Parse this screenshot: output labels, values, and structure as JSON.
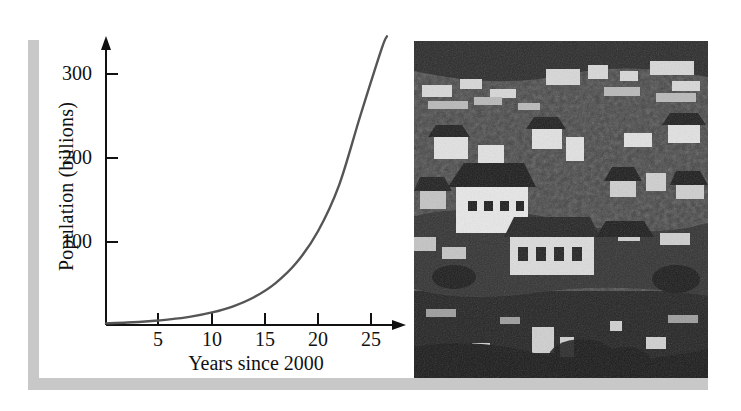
{
  "figure": {
    "kind": "textbook-figure",
    "caption_visible": false
  },
  "chart_data": {
    "type": "line",
    "title": "",
    "xlabel": "Years since 2000",
    "ylabel": "Population (billions)",
    "xlim": [
      0,
      27.5
    ],
    "ylim": [
      0,
      345
    ],
    "xticks": [
      5,
      10,
      15,
      20,
      25
    ],
    "xtick_labels": [
      "5",
      "10",
      "15",
      "20",
      "25"
    ],
    "yticks": [
      100,
      200,
      300
    ],
    "ytick_labels": [
      "100",
      "200",
      "300"
    ],
    "grid": false,
    "legend": "none",
    "axis_arrows": true,
    "series": [
      {
        "name": "Population",
        "x": [
          0,
          2,
          4,
          6,
          8,
          10,
          12,
          14,
          16,
          18,
          20,
          22,
          24,
          26,
          26.5
        ],
        "values": [
          2.0,
          3.0,
          4.5,
          6.7,
          10.0,
          15.0,
          22.4,
          33.5,
          50.1,
          74.9,
          112.0,
          167.5,
          250.4,
          330.0,
          345.0
        ],
        "color": "#555555"
      }
    ],
    "annotations": [
      "curve crosses 100 billion near year 19",
      "curve reaches about 220 billion at year 25"
    ]
  },
  "photo": {
    "alt": "Dense hillside settlement of closely packed houses, black and white photograph",
    "style": "grayscale-halftone"
  },
  "decor": {
    "frame_color": "#c8c8c8",
    "axis_color": "#111111",
    "curve_color": "#555555",
    "background": "#ffffff"
  }
}
